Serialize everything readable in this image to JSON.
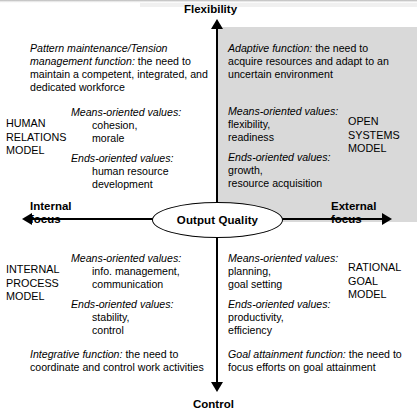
{
  "axes": {
    "top_label": "Flexibility",
    "bottom_label": "Control",
    "left_label": "Internal\nfocus",
    "right_label": "External\nfocus"
  },
  "center": {
    "label": "Output Quality"
  },
  "quadrants": {
    "human_relations": {
      "model_name": "HUMAN\nRELATIONS\nMODEL",
      "function_title": "Pattern maintenance/Tension management function:",
      "function_text": " the need to maintain a competent, integrated, and dedicated workforce",
      "means_heading": "Means-oriented values:",
      "means_values": "cohesion,\nmorale",
      "ends_heading": "Ends-oriented values:",
      "ends_values": "human resource\ndevelopment"
    },
    "open_systems": {
      "model_name": "OPEN\nSYSTEMS\nMODEL",
      "function_title": "Adaptive function:",
      "function_text": " the need to acquire resources and adapt to an uncertain environment",
      "means_heading": "Means-oriented values:",
      "means_values": "flexibility,\nreadiness",
      "ends_heading": "Ends-oriented values:",
      "ends_values": "growth,\nresource acquisition"
    },
    "internal_process": {
      "model_name": "INTERNAL\nPROCESS\nMODEL",
      "function_title": "Integrative function:",
      "function_text": " the need to coordinate and control work activities",
      "means_heading": "Means-oriented values:",
      "means_values": "info. management,\ncommunication",
      "ends_heading": "Ends-oriented values:",
      "ends_values": "stability,\ncontrol"
    },
    "rational_goal": {
      "model_name": "RATIONAL\nGOAL\nMODEL",
      "function_title": "Goal attainment function:",
      "function_text": " the need to focus efforts on goal attainment",
      "means_heading": "Means-oriented values:",
      "means_values": "planning,\ngoal setting",
      "ends_heading": "Ends-oriented values:",
      "ends_values": "productivity,\nefficiency"
    }
  },
  "colors": {
    "highlight_quadrant": "#d9d9d9",
    "axis": "#000000",
    "background": "#ffffff"
  }
}
